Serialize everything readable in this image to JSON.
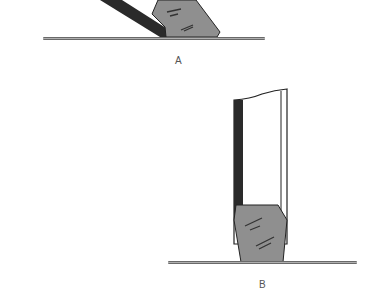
{
  "figure": {
    "panels": [
      {
        "id": "A",
        "label": "A",
        "description": "Tool held at an angle resting on a flat surface, wedge/bevel face down"
      },
      {
        "id": "B",
        "label": "B",
        "description": "Tool held vertically standing on a flat surface, wedge end down"
      }
    ],
    "colors": {
      "handle_dark": "#2a2a2a",
      "wedge_fill": "#8f8f8f",
      "surface": "#6a6a6a",
      "outline": "#222222"
    }
  }
}
